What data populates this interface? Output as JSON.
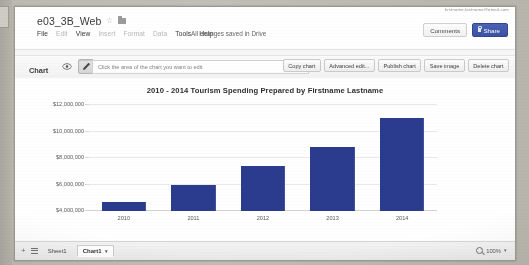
{
  "window": {
    "account_email": "firstname.lastname@gmail.com"
  },
  "document": {
    "title": "e03_3B_Web",
    "star_icon": "star-outline-icon",
    "folder_icon": "folder-icon",
    "save_status": "All changes saved in Drive"
  },
  "menubar": {
    "items": [
      {
        "label": "File",
        "enabled": true
      },
      {
        "label": "Edit",
        "enabled": false
      },
      {
        "label": "View",
        "enabled": true
      },
      {
        "label": "Insert",
        "enabled": false
      },
      {
        "label": "Format",
        "enabled": false
      },
      {
        "label": "Data",
        "enabled": false
      },
      {
        "label": "Tools",
        "enabled": true
      },
      {
        "label": "Help",
        "enabled": true
      }
    ]
  },
  "header_buttons": {
    "comments_label": "Comments",
    "share_label": "Share",
    "share_lock_icon": "lock-icon",
    "share_color": "#3b52a4"
  },
  "chart_toolbar": {
    "section_label": "Chart",
    "eye_icon": "eye-icon",
    "pencil_icon": "pencil-icon",
    "pencil_selected": true,
    "hint": "Click the area of the chart you want to edit",
    "buttons": [
      "Copy chart",
      "Advanced edit...",
      "Publish chart",
      "Save image",
      "Delete chart"
    ]
  },
  "chart_data": {
    "type": "bar",
    "title": "2010 - 2014 Tourism Spending Prepared by Firstname Lastname",
    "xlabel": "",
    "ylabel": "",
    "categories": [
      "2010",
      "2011",
      "2012",
      "2013",
      "2014"
    ],
    "values": [
      4700000,
      6000000,
      7400000,
      8800000,
      11000000
    ],
    "ylim": [
      4000000,
      12000000
    ],
    "ytick_values": [
      4000000,
      6000000,
      8000000,
      10000000,
      12000000
    ],
    "ytick_labels": [
      "$4,000,000",
      "$6,000,000",
      "$8,000,000",
      "$10,000,000",
      "$12,000,000"
    ],
    "grid": true,
    "legend": false,
    "legend_position": "none",
    "bar_color": "#2b3b8e"
  },
  "sheetbar": {
    "add_sheet_icon": "plus-icon",
    "all_sheets_icon": "list-menu-icon",
    "tabs": [
      {
        "label": "Sheet1",
        "active": false
      },
      {
        "label": "Chart1",
        "active": true
      }
    ],
    "active_tab_caret": "chevron-down-icon",
    "zoom_icon": "magnifier-icon",
    "zoom_level": "100%",
    "zoom_caret": "chevron-down-icon"
  }
}
